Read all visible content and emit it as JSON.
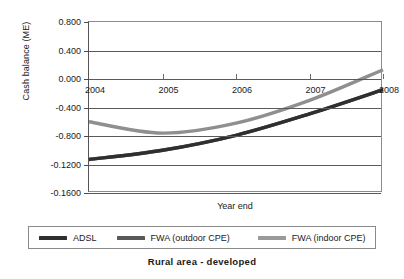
{
  "chart_data": {
    "type": "line",
    "title": "Rural area - developed",
    "xlabel": "Year end",
    "ylabel": "Cash balance (ME)",
    "grid": true,
    "legend_position": "bottom",
    "categories": [
      "2004",
      "2005",
      "2006",
      "2007",
      "2008"
    ],
    "x_tick_labels": [
      "2004",
      "2005",
      "2006",
      "2007",
      "2008"
    ],
    "y_tick_labels": [
      "0.800",
      "0.400",
      "0.000",
      "-0.400",
      "-0.800",
      "-0.1200",
      "-0.1600"
    ],
    "y_tick_values": [
      0.8,
      0.4,
      0.0,
      -0.4,
      -0.8,
      -1.2,
      -1.6
    ],
    "ylim": [
      -1.6,
      0.8
    ],
    "series": [
      {
        "name": "ADSL",
        "color": "#2f2f2f",
        "values": [
          -1.13,
          -1.0,
          -0.79,
          -0.49,
          -0.15
        ]
      },
      {
        "name": "FWA (outdoor CPE)",
        "color": "#595959",
        "values": [
          -1.13,
          -1.0,
          -0.79,
          -0.49,
          -0.15
        ]
      },
      {
        "name": "FWA (indoor CPE)",
        "color": "#8f8f8f",
        "values": [
          -0.6,
          -0.76,
          -0.62,
          -0.3,
          0.13
        ]
      }
    ]
  },
  "legend": {
    "items": [
      {
        "label": "ADSL",
        "color": "#2f2f2f"
      },
      {
        "label": "FWA (outdoor CPE)",
        "color": "#595959"
      },
      {
        "label": "FWA (indoor CPE)",
        "color": "#9a9a9a"
      }
    ]
  }
}
